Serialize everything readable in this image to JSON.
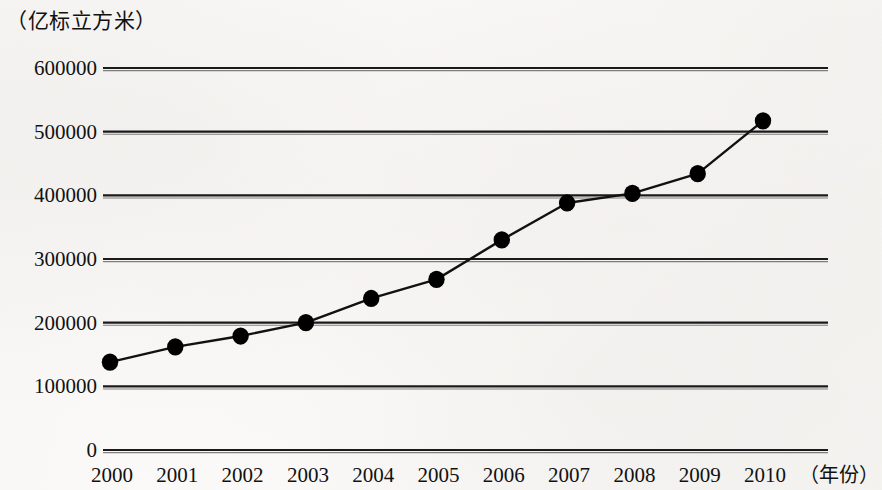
{
  "chart_data": {
    "type": "line",
    "title": "",
    "subtitle": "",
    "unit_label": "（亿标立方米）",
    "xlabel": "（年份）",
    "ylabel": "",
    "grid": true,
    "legend": false,
    "legend_position": "none",
    "marker": "filled-circle",
    "line_color": "#111111",
    "marker_color": "#000000",
    "grid_color": "#1a1a1a",
    "xlim": [
      1999.4,
      2010.7
    ],
    "ylim": [
      0,
      600000
    ],
    "ytick_labels": [
      "600000",
      "500000",
      "400000",
      "300000",
      "200000",
      "100000",
      "0"
    ],
    "ytick_values": [
      600000,
      500000,
      400000,
      300000,
      200000,
      100000,
      0
    ],
    "categories": [
      "2000",
      "2001",
      "2002",
      "2003",
      "2004",
      "2005",
      "2006",
      "2007",
      "2008",
      "2009",
      "2010"
    ],
    "x": [
      2000,
      2001,
      2002,
      2003,
      2004,
      2005,
      2006,
      2007,
      2008,
      2009,
      2010
    ],
    "values": [
      138000,
      162000,
      179000,
      200000,
      238000,
      268000,
      330000,
      388000,
      403000,
      434000,
      517000
    ],
    "series": [
      {
        "name": "能源消费总量",
        "values": [
          138000,
          162000,
          179000,
          200000,
          238000,
          268000,
          330000,
          388000,
          403000,
          434000,
          517000
        ]
      }
    ]
  }
}
